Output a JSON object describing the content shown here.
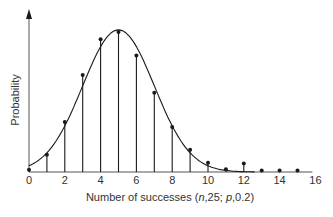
{
  "chart_data": {
    "type": "scatter",
    "subtype": "stem plot with fitted normal curve",
    "title": "",
    "xlabel": "Number of successes (n,25; p,0.2)",
    "ylabel": "Probability",
    "xlim": [
      0,
      16
    ],
    "ylim": [
      0,
      0.24
    ],
    "x_ticks": [
      0,
      2,
      4,
      6,
      8,
      10,
      12,
      14,
      16
    ],
    "y_ticks": [],
    "grid": false,
    "legend": null,
    "series": [
      {
        "name": "Binomial probabilities",
        "style": "stems with dot markers",
        "x": [
          0,
          1,
          2,
          3,
          4,
          5,
          6,
          7,
          8,
          9,
          10,
          11,
          12,
          13,
          14,
          15
        ],
        "values": [
          0.003,
          0.024,
          0.07,
          0.136,
          0.186,
          0.196,
          0.163,
          0.111,
          0.063,
          0.031,
          0.013,
          0.004,
          0.012,
          0.002,
          0.002,
          0.002
        ]
      },
      {
        "name": "Normal approximation",
        "style": "smooth curve",
        "mean": 5,
        "sd": 2,
        "peak_value": 0.199
      }
    ]
  },
  "labels": {
    "xlabel_prefix": "Number of successes (",
    "xlabel_n": "n",
    "xlabel_mid": ",25; ",
    "xlabel_p": "p",
    "xlabel_suffix": ",0.2)",
    "ylabel": "Probability"
  },
  "colors": {
    "ink": "#1a1a1a",
    "text": "#333333",
    "background": "#ffffff"
  }
}
